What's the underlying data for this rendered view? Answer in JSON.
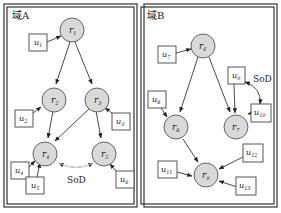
{
  "domains": [
    {
      "title": "域A",
      "sod_label": "SoD"
    },
    {
      "title": "域B",
      "sod_label": "SoD"
    }
  ],
  "roles": {
    "r1": {
      "main": "r",
      "sub": "1"
    },
    "r2": {
      "main": "r",
      "sub": "2"
    },
    "r3": {
      "main": "r",
      "sub": "3"
    },
    "r4": {
      "main": "r",
      "sub": "4"
    },
    "r5": {
      "main": "r",
      "sub": "5"
    },
    "r6": {
      "main": "r",
      "sub": "6"
    },
    "r7": {
      "main": "r",
      "sub": "7"
    },
    "r8": {
      "main": "r",
      "sub": "8"
    },
    "r9": {
      "main": "r",
      "sub": "9"
    }
  },
  "users": {
    "u1": {
      "main": "u",
      "sub": "1"
    },
    "u2": {
      "main": "u",
      "sub": "2"
    },
    "u3": {
      "main": "u",
      "sub": "3"
    },
    "u4": {
      "main": "u",
      "sub": "4"
    },
    "u5": {
      "main": "u",
      "sub": "5"
    },
    "u6": {
      "main": "u",
      "sub": "6"
    },
    "u7": {
      "main": "u",
      "sub": "7"
    },
    "u8": {
      "main": "u",
      "sub": "8"
    },
    "u9": {
      "main": "u",
      "sub": "9"
    },
    "u10": {
      "main": "u",
      "sub": "10"
    },
    "u11": {
      "main": "u",
      "sub": "11"
    },
    "u12": {
      "main": "u",
      "sub": "12"
    },
    "u13": {
      "main": "u",
      "sub": "13"
    }
  }
}
